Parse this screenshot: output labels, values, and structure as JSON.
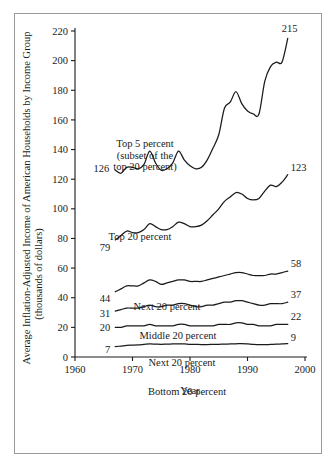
{
  "chart_data": {
    "type": "line",
    "title": "",
    "xlabel": "Year",
    "ylabel": "Average Inflation-Adjusted Income of American Households by Income Group (thousands of dollars)",
    "ylabel_line1": "Average Inflation-Adjusted Income of American Households by Income Group",
    "ylabel_line2": "(thousands of dollars)",
    "xlim": [
      1960,
      2000
    ],
    "ylim": [
      0,
      220
    ],
    "grid": false,
    "legend_position": "inline-annotations",
    "xticks": [
      1960,
      1970,
      1980,
      1990,
      2000
    ],
    "yticks": [
      0,
      20,
      40,
      60,
      80,
      100,
      120,
      140,
      160,
      180,
      200,
      220
    ],
    "xtick_labels": [
      "1960",
      "1970",
      "1980",
      "1990",
      "2000"
    ],
    "ytick_labels": [
      "0",
      "20",
      "40",
      "60",
      "80",
      "100",
      "120",
      "140",
      "160",
      "180",
      "200",
      "220"
    ],
    "line_color": "#1a1a1a",
    "series": [
      {
        "name": "Top 5 percent",
        "label": "Top 5 percent",
        "label_line2": "(subset of the",
        "label_line3": "top 20 percent)",
        "start_label": "126",
        "end_label": "215",
        "x": [
          1967,
          1968,
          1969,
          1970,
          1971,
          1972,
          1973,
          1974,
          1975,
          1976,
          1977,
          1978,
          1979,
          1980,
          1981,
          1982,
          1983,
          1984,
          1985,
          1986,
          1987,
          1988,
          1989,
          1990,
          1991,
          1992,
          1993,
          1994,
          1995,
          1996,
          1997
        ],
        "values": [
          126,
          124,
          128,
          128,
          127,
          130,
          139,
          131,
          126,
          127,
          131,
          139,
          133,
          129,
          127,
          128,
          133,
          141,
          150,
          168,
          172,
          179,
          171,
          166,
          164,
          164,
          186,
          196,
          199,
          199,
          215
        ]
      },
      {
        "name": "Top 20 percent",
        "label": "Top 20 percent",
        "start_label": "79",
        "end_label": "123",
        "x": [
          1967,
          1968,
          1969,
          1970,
          1971,
          1972,
          1973,
          1974,
          1975,
          1976,
          1977,
          1978,
          1979,
          1980,
          1981,
          1982,
          1983,
          1984,
          1985,
          1986,
          1987,
          1988,
          1989,
          1990,
          1991,
          1992,
          1993,
          1994,
          1995,
          1996,
          1997
        ],
        "values": [
          79,
          82,
          85,
          84,
          84,
          86,
          90,
          88,
          86,
          86,
          88,
          91,
          90,
          88,
          88,
          89,
          92,
          96,
          100,
          105,
          108,
          111,
          110,
          107,
          106,
          107,
          112,
          116,
          115,
          118,
          123
        ]
      },
      {
        "name": "Next 20 percent",
        "label": "Next 20 percent",
        "start_label": "44",
        "end_label": "58",
        "x": [
          1967,
          1968,
          1969,
          1970,
          1971,
          1972,
          1973,
          1974,
          1975,
          1976,
          1977,
          1978,
          1979,
          1980,
          1981,
          1982,
          1983,
          1984,
          1985,
          1986,
          1987,
          1988,
          1989,
          1990,
          1991,
          1992,
          1993,
          1994,
          1995,
          1996,
          1997
        ],
        "values": [
          44,
          46,
          48,
          48,
          48,
          50,
          52,
          51,
          49,
          50,
          51,
          52,
          52,
          51,
          51,
          51,
          52,
          53,
          54,
          55,
          56,
          57,
          57,
          56,
          55,
          55,
          55,
          56,
          56,
          57,
          58
        ]
      },
      {
        "name": "Middle 20 percent",
        "label": "Middle 20 percent",
        "start_label": "31",
        "end_label": "37",
        "x": [
          1967,
          1968,
          1969,
          1970,
          1971,
          1972,
          1973,
          1974,
          1975,
          1976,
          1977,
          1978,
          1979,
          1980,
          1981,
          1982,
          1983,
          1984,
          1985,
          1986,
          1987,
          1988,
          1989,
          1990,
          1991,
          1992,
          1993,
          1994,
          1995,
          1996,
          1997
        ],
        "values": [
          31,
          32,
          33,
          33,
          33,
          34,
          35,
          34,
          34,
          35,
          35,
          36,
          36,
          35,
          34,
          34,
          35,
          35,
          36,
          37,
          37,
          38,
          38,
          37,
          36,
          35,
          35,
          36,
          36,
          36,
          37
        ]
      },
      {
        "name": "Next 20 percent (second quintile)",
        "label": "Next 20 percent",
        "start_label": "20",
        "end_label": "22",
        "x": [
          1967,
          1968,
          1969,
          1970,
          1971,
          1972,
          1973,
          1974,
          1975,
          1976,
          1977,
          1978,
          1979,
          1980,
          1981,
          1982,
          1983,
          1984,
          1985,
          1986,
          1987,
          1988,
          1989,
          1990,
          1991,
          1992,
          1993,
          1994,
          1995,
          1996,
          1997
        ],
        "values": [
          20,
          20,
          21,
          21,
          21,
          21,
          22,
          21,
          21,
          21,
          21,
          22,
          22,
          21,
          21,
          21,
          21,
          21,
          22,
          22,
          22,
          23,
          23,
          22,
          22,
          21,
          21,
          21,
          22,
          22,
          22
        ]
      },
      {
        "name": "Bottom 20 percent",
        "label": "Bottom 20 percent",
        "start_label": "7",
        "end_label": "9",
        "x": [
          1967,
          1968,
          1969,
          1970,
          1971,
          1972,
          1973,
          1974,
          1975,
          1976,
          1977,
          1978,
          1979,
          1980,
          1981,
          1982,
          1983,
          1984,
          1985,
          1986,
          1987,
          1988,
          1989,
          1990,
          1991,
          1992,
          1993,
          1994,
          1995,
          1996,
          1997
        ],
        "values": [
          7,
          7.4,
          7.8,
          8,
          8.2,
          8.5,
          8.8,
          8.7,
          8.6,
          8.7,
          8.8,
          8.9,
          8.9,
          8.6,
          8.5,
          8.4,
          8.4,
          8.5,
          8.6,
          8.7,
          8.8,
          8.9,
          9,
          8.8,
          8.5,
          8.4,
          8.3,
          8.5,
          8.7,
          8.8,
          9
        ]
      }
    ]
  }
}
